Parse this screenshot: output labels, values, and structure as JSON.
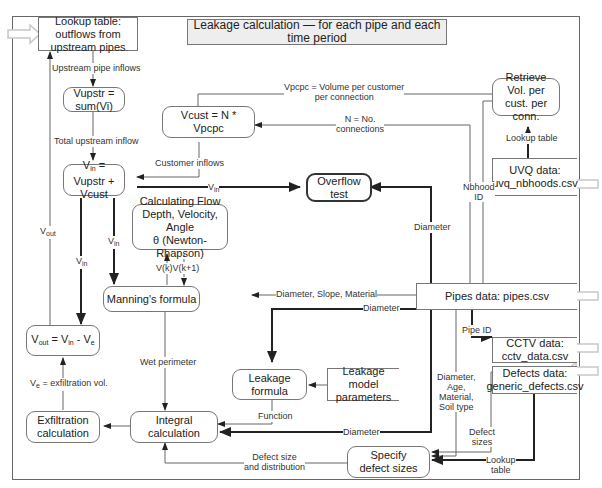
{
  "title": "Leakage calculation — for each pipe and each time period",
  "nodes": {
    "lookup_outflows": "Lookup table: outflows from upstream pipes",
    "vupstr": "Vupstr = sum(Vi)",
    "vcust": "Vcust = N * Vpcpc",
    "vin_main": "Vupstr + Vcust",
    "vin_sym": "V",
    "vin_sub": "in",
    "overflow": "Overflow test",
    "newton": "Calculating Flow Depth, Velocity, Angle",
    "newton_theta": "θ (Newton-Rhapson)",
    "manning": "Manning's formula",
    "vout_sym": "V",
    "vout_sub": "out",
    "vout_eq": " = V",
    "vout_in_sub": "in",
    "vout_minus": " - V",
    "vout_e_sub": "e",
    "exfiltration": "Exfiltration calculation",
    "integral": "Integral calculation",
    "leakage_formula": "Leakage formula",
    "leakage_params": "Leakage model parameters",
    "specify_defects": "Specify defect sizes",
    "retrieve_vol": "Retrieve Vol. per cust. per conn.",
    "uvq_title": "UVQ data:",
    "uvq_file": "uvq_nbhoods.csv",
    "pipes": "Pipes data: pipes.csv",
    "cctv_title": "CCTV data:",
    "cctv_file": "cctv_data.csv",
    "defects_title": "Defects data:",
    "defects_file": "generic_defects.csv"
  },
  "labels": {
    "upstream_inflows": "Upstream pipe inflows",
    "total_upstream": "Total upstream inflow",
    "vpcpc_line1": "Vpcpc  = Volume per customer",
    "vpcpc_line2": "per connection",
    "n_line1": "N = No.",
    "n_line2": "connections",
    "customer_inflows": "Customer inflows",
    "v_sym": "V",
    "in_sub": "in",
    "out_sub": "out",
    "e_sub": "e",
    "nbhood_line1": "Nbhood",
    "nbhood_line2": "ID",
    "lookup_table": "Lookup table",
    "diameter": "Diameter",
    "dsm": "Diameter, Slope, Material",
    "vk": "V(k)V(k+1)",
    "wet_perimeter": "Wet perimeter",
    "function": "Function",
    "pipe_id": "Pipe ID",
    "damst_1": "Diameter,",
    "damst_2": "Age,",
    "damst_3": "Material,",
    "damst_4": "Soil type",
    "defect_sizes_1": "Defect",
    "defect_sizes_2": "sizes",
    "lookup_1": "Lookup",
    "lookup_2": "table",
    "defect_dist_1": "Defect size",
    "defect_dist_2": "and distribution",
    "exfil_vol": " = exfiltration vol."
  }
}
